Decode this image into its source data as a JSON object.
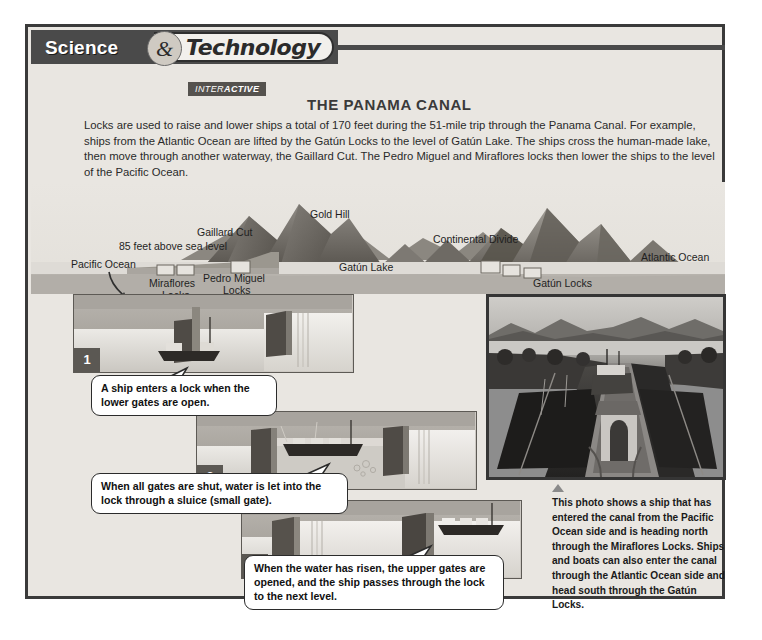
{
  "banner": {
    "science": "Science",
    "ampersand": "&",
    "technology": "Technology",
    "interactive_prefix": "INTER",
    "interactive_suffix": "ACTIVE"
  },
  "headline": "THE PANAMA CANAL",
  "intro": "Locks are used to raise and lower ships a total of 170 feet during the 51-mile trip through the Panama Canal. For example, ships from the Atlantic Ocean are lifted by the Gatún Locks to the level of Gatún Lake. The ships cross the human-made lake, then move through another waterway, the Gaillard Cut. The Pedro Miguel and Miraflores locks then lower the ships to the level of the Pacific Ocean.",
  "map_labels": {
    "gold_hill": "Gold Hill",
    "gaillard_cut": "Gaillard Cut",
    "elevation": "85 feet above sea level",
    "continental_divide": "Continental Divide",
    "pacific_ocean": "Pacific Ocean",
    "atlantic_ocean": "Atlantic Ocean",
    "gatun_lake": "Gatún Lake",
    "miraflores_locks": "Miraflores\nLocks",
    "miraflores_line1": "Miraflores",
    "miraflores_line2": "Locks",
    "pedro_miguel_line1": "Pedro Miguel",
    "pedro_miguel_line2": "Locks",
    "gatun_locks": "Gatún Locks"
  },
  "steps": [
    {
      "number": "1",
      "caption": "A ship enters a lock when the lower gates are open."
    },
    {
      "number": "2",
      "caption": "When all gates are shut, water is let into the lock through a sluice (small gate)."
    },
    {
      "number": "3",
      "caption": "When the water has risen, the upper gates are opened, and the ship passes through the lock to the next level."
    }
  ],
  "photo_caption": "This photo shows a ship that has entered the canal from the Pacific Ocean side and is heading north through the Miraflores Locks. Ships and boats can also enter the canal through the Atlantic Ocean side and head south through the Gatún Locks.",
  "colors": {
    "page_background": "#e9e6e1",
    "frame_border": "#3a3a3a",
    "banner_dark": "#4a4a4a",
    "banner_pill": "#f2f0ec",
    "text_dark": "#2a2a2a",
    "water": "#d9d7d2",
    "land": "#b6b2ac",
    "mountain": "#6f6b66",
    "step_badge": "#5b5853"
  }
}
